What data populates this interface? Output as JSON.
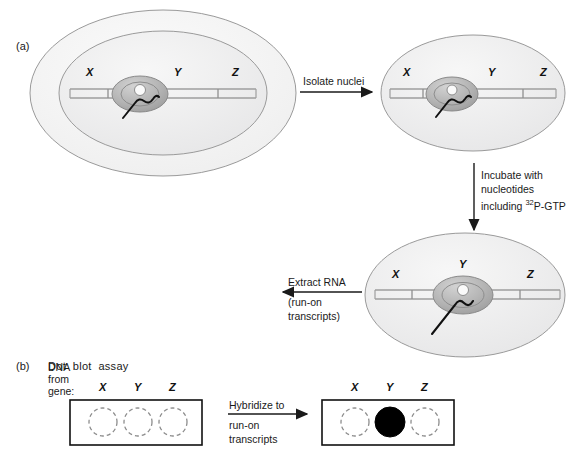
{
  "figure": {
    "panels": [
      {
        "letter": "(a)"
      },
      {
        "letter": "(b)",
        "title": "Dot  blot  assay"
      }
    ]
  },
  "gene_labels": {
    "x": "X",
    "y": "Y",
    "z": "Z"
  },
  "steps": {
    "isolate": {
      "label": "Isolate nuclei",
      "direction": "right"
    },
    "incubate": {
      "line1": "Incubate with",
      "line2": "nucleotides",
      "line3_pre": "including ",
      "line3_sup": "32",
      "line3_post": "P-GTP",
      "direction": "down"
    },
    "extract": {
      "line1": "Extract RNA",
      "line2": "(run-on",
      "line3": "transcripts)",
      "direction": "left"
    },
    "hybridize": {
      "line1": "Hybridize to",
      "line2": "run-on",
      "line3": "transcripts",
      "direction": "right"
    }
  },
  "cells": [
    {
      "name": "intact-cell",
      "has_cell_membrane": true,
      "polymerase_position": "between-X-and-Y",
      "transcript_length": "short",
      "genes": [
        "X",
        "Y",
        "Z"
      ]
    },
    {
      "name": "isolated-nucleus",
      "has_cell_membrane": false,
      "polymerase_position": "between-X-and-Y",
      "transcript_length": "short",
      "genes": [
        "X",
        "Y",
        "Z"
      ]
    },
    {
      "name": "incubated-nucleus",
      "has_cell_membrane": false,
      "polymerase_position": "at-Y",
      "transcript_length": "long",
      "genes": [
        "X",
        "Y",
        "Z"
      ]
    }
  ],
  "rna_product": {
    "name": "run-on-transcript",
    "description": "extracted labeled RNA strand"
  },
  "dot_blot": {
    "dna_from_gene_label": {
      "line1": "DNA",
      "line2": "from",
      "line3": "gene:"
    },
    "before": {
      "name": "dot-blot-before",
      "columns": [
        "X",
        "Y",
        "Z"
      ],
      "spots": [
        {
          "gene": "X",
          "filled": false
        },
        {
          "gene": "Y",
          "filled": false
        },
        {
          "gene": "Z",
          "filled": false
        }
      ]
    },
    "after": {
      "name": "dot-blot-after",
      "columns": [
        "X",
        "Y",
        "Z"
      ],
      "spots": [
        {
          "gene": "X",
          "filled": false
        },
        {
          "gene": "Y",
          "filled": true
        },
        {
          "gene": "Z",
          "filled": false
        }
      ]
    }
  },
  "colors": {
    "cytoplasm": "#f2f2f2",
    "nucleoplasm": "#ececed",
    "polymerase": "#b6b6b6",
    "outline": "#8a8a8a",
    "dna": "#9a9a9a",
    "ink": "#1a1a1a",
    "spot_filled": "#000000",
    "spot_empty_stroke": "#8c8c8c"
  }
}
